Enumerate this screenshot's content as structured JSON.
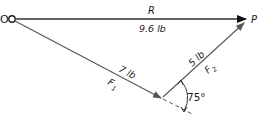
{
  "diagram": {
    "type": "vector-force-diagram",
    "points": {
      "origin": {
        "label": "O"
      },
      "end": {
        "label": "P"
      }
    },
    "vectors": [
      {
        "id": "R",
        "name": "R",
        "magnitude": "9.6 lb",
        "from": "O",
        "to": "P"
      },
      {
        "id": "F1",
        "name": "F",
        "subscript": "1",
        "magnitude": "7 lb",
        "from": "O",
        "to": "junction"
      },
      {
        "id": "F2",
        "name": "F",
        "subscript": "2",
        "magnitude": "5 lb",
        "from": "junction",
        "to": "P"
      }
    ],
    "angle": {
      "value": "75°",
      "between": [
        "F2",
        "F1-extension"
      ]
    }
  },
  "colors": {
    "line": "#555555",
    "text": "#1a1a1a",
    "background": "#ffffff"
  }
}
